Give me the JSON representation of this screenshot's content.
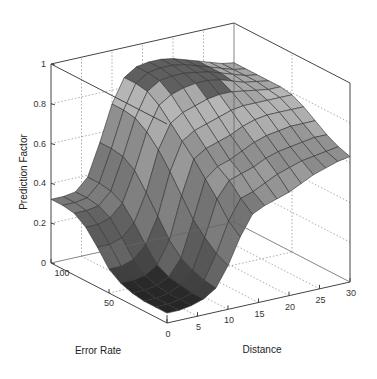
{
  "chart_data": {
    "type": "surface3d",
    "title": "",
    "xlabel": "Distance",
    "ylabel": "Error Rate",
    "zlabel": "Prediction Factor",
    "x_ticks": [
      "0",
      "5",
      "10",
      "15",
      "20",
      "25",
      "30"
    ],
    "y_ticks": [
      "0",
      "50",
      "100"
    ],
    "z_ticks": [
      "0",
      "0.2",
      "0.4",
      "0.6",
      "0.8",
      "1"
    ],
    "xlim": [
      0,
      30
    ],
    "ylim": [
      0,
      100
    ],
    "zlim": [
      0,
      1
    ],
    "grid": true,
    "colormap": "gray",
    "x": [
      0,
      2,
      4,
      6,
      8,
      10,
      12,
      14,
      16,
      18,
      20,
      22,
      24,
      26,
      28,
      30
    ],
    "y": [
      0,
      10,
      20,
      30,
      40,
      50,
      60,
      70,
      80,
      90,
      100
    ],
    "z": [
      [
        0.05,
        0.05,
        0.06,
        0.08,
        0.12,
        0.22,
        0.35,
        0.45,
        0.48,
        0.5,
        0.52,
        0.55,
        0.58,
        0.6,
        0.62,
        0.63
      ],
      [
        0.05,
        0.05,
        0.06,
        0.08,
        0.13,
        0.25,
        0.4,
        0.5,
        0.52,
        0.55,
        0.58,
        0.6,
        0.62,
        0.63,
        0.64,
        0.65
      ],
      [
        0.05,
        0.05,
        0.06,
        0.09,
        0.15,
        0.3,
        0.48,
        0.56,
        0.58,
        0.6,
        0.63,
        0.65,
        0.66,
        0.67,
        0.68,
        0.68
      ],
      [
        0.06,
        0.06,
        0.07,
        0.1,
        0.18,
        0.36,
        0.55,
        0.6,
        0.62,
        0.65,
        0.68,
        0.7,
        0.71,
        0.72,
        0.72,
        0.72
      ],
      [
        0.08,
        0.08,
        0.09,
        0.13,
        0.24,
        0.45,
        0.62,
        0.66,
        0.68,
        0.7,
        0.73,
        0.75,
        0.76,
        0.76,
        0.76,
        0.76
      ],
      [
        0.12,
        0.12,
        0.14,
        0.2,
        0.33,
        0.54,
        0.68,
        0.72,
        0.74,
        0.76,
        0.78,
        0.79,
        0.79,
        0.79,
        0.79,
        0.79
      ],
      [
        0.2,
        0.2,
        0.22,
        0.28,
        0.42,
        0.62,
        0.74,
        0.78,
        0.8,
        0.82,
        0.83,
        0.83,
        0.82,
        0.81,
        0.8,
        0.8
      ],
      [
        0.27,
        0.27,
        0.29,
        0.35,
        0.5,
        0.68,
        0.8,
        0.84,
        0.86,
        0.87,
        0.87,
        0.86,
        0.84,
        0.82,
        0.81,
        0.8
      ],
      [
        0.31,
        0.31,
        0.32,
        0.38,
        0.54,
        0.72,
        0.84,
        0.88,
        0.89,
        0.89,
        0.88,
        0.87,
        0.85,
        0.83,
        0.81,
        0.8
      ],
      [
        0.32,
        0.32,
        0.33,
        0.39,
        0.55,
        0.73,
        0.85,
        0.89,
        0.9,
        0.9,
        0.89,
        0.87,
        0.85,
        0.83,
        0.81,
        0.8
      ],
      [
        0.32,
        0.32,
        0.33,
        0.39,
        0.55,
        0.73,
        0.85,
        0.89,
        0.9,
        0.9,
        0.89,
        0.87,
        0.85,
        0.83,
        0.81,
        0.8
      ]
    ]
  },
  "labels": {
    "xlabel": "Distance",
    "ylabel": "Error Rate",
    "zlabel": "Prediction Factor"
  }
}
